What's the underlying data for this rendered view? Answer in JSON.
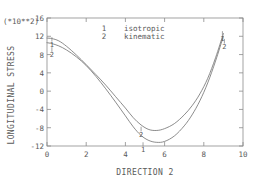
{
  "chart_data": {
    "type": "line",
    "title": "",
    "xlabel": "DIRECTION 2",
    "ylabel": "LONGITUDINAL STRESS",
    "y_exponent_note": "(*10**2)",
    "xlim": [
      0,
      10
    ],
    "ylim": [
      -12,
      16
    ],
    "xticks": [
      0,
      2,
      4,
      6,
      8,
      10
    ],
    "xtick_labels": [
      "0",
      "2",
      "4",
      "6",
      "8",
      "10"
    ],
    "yticks": [
      -12,
      -8,
      -4,
      0,
      4,
      8,
      12,
      16
    ],
    "ytick_labels": [
      "-12",
      "-8",
      "-4",
      "0",
      "4",
      "8",
      "12",
      "16"
    ],
    "grid": false,
    "legend_position": "top-center",
    "legend": [
      {
        "marker": "1",
        "label": "isotropic"
      },
      {
        "marker": "2",
        "label": "kinematic"
      }
    ],
    "series": [
      {
        "name": "isotropic",
        "marker": "1",
        "x": [
          0.0,
          0.25,
          0.6,
          1.0,
          1.5,
          2.0,
          2.5,
          3.0,
          3.5,
          4.0,
          4.4,
          4.8,
          5.2,
          5.6,
          6.0,
          6.5,
          7.0,
          7.4,
          7.8,
          8.2,
          8.6,
          9.0
        ],
        "y": [
          11.6,
          11.5,
          11.0,
          9.8,
          7.9,
          5.8,
          3.6,
          1.3,
          -1.2,
          -3.7,
          -5.8,
          -7.4,
          -8.4,
          -8.6,
          -8.2,
          -7.1,
          -5.2,
          -3.2,
          -0.6,
          2.8,
          7.3,
          12.6
        ]
      },
      {
        "name": "kinematic",
        "marker": "2",
        "x": [
          0.0,
          0.25,
          0.6,
          1.0,
          1.5,
          2.0,
          2.5,
          3.0,
          3.5,
          4.0,
          4.4,
          4.8,
          5.2,
          5.6,
          6.0,
          6.5,
          7.0,
          7.4,
          7.8,
          8.2,
          8.6,
          9.0
        ],
        "y": [
          10.6,
          10.4,
          9.9,
          9.0,
          7.5,
          5.6,
          3.2,
          0.5,
          -2.4,
          -5.4,
          -7.8,
          -9.7,
          -10.8,
          -11.2,
          -11.0,
          -9.8,
          -7.6,
          -5.2,
          -2.1,
          1.8,
          6.6,
          12.0
        ]
      }
    ],
    "inline_curve_labels": [
      {
        "text": "1",
        "x": 0.25,
        "y": 11.6
      },
      {
        "text": "2",
        "x": 0.25,
        "y": 9.4
      },
      {
        "text": "2",
        "x": 4.8,
        "y": -8.0
      },
      {
        "text": "1",
        "x": 4.9,
        "y": -11.4
      },
      {
        "text": "1",
        "x": 8.95,
        "y": 12.9
      },
      {
        "text": "2",
        "x": 9.05,
        "y": 11.2
      }
    ],
    "colors": {
      "curve": "#6e6e6e",
      "axis": "#8c8c8c",
      "text": "#5a5a5a",
      "background": "#ffffff"
    }
  }
}
